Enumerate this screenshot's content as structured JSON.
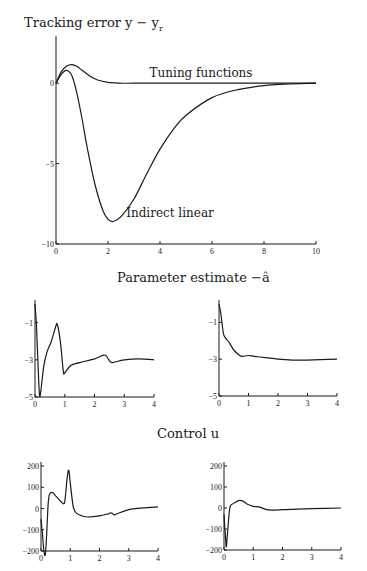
{
  "titles": {
    "tracking": "Tracking error y − y",
    "tracking_sub": "r",
    "parameter": "Parameter estimate −â",
    "control": "Control u"
  },
  "chart_data": [
    {
      "type": "line",
      "title": "Tracking error y - y_r",
      "xlabel": "",
      "ylabel": "",
      "xlim": [
        0,
        10
      ],
      "ylim": [
        -10,
        2
      ],
      "xticks": [
        0,
        2,
        4,
        6,
        8,
        10
      ],
      "yticks": [
        0,
        -5,
        -10
      ],
      "annotations": [
        "Tuning functions",
        "Indirect linear"
      ],
      "series": [
        {
          "name": "Tuning functions",
          "x": [
            0,
            0.2,
            0.4,
            0.6,
            0.8,
            1.0,
            1.3,
            1.6,
            2.0,
            2.5,
            3,
            4,
            6,
            8,
            10
          ],
          "y": [
            0,
            0.7,
            1.05,
            1.15,
            1.05,
            0.8,
            0.45,
            0.2,
            0.05,
            0.0,
            0.0,
            0.0,
            0.0,
            0.0,
            0.0
          ]
        },
        {
          "name": "Indirect linear",
          "x": [
            0,
            0.2,
            0.4,
            0.6,
            0.8,
            1.0,
            1.2,
            1.5,
            1.8,
            2.0,
            2.2,
            2.5,
            3.0,
            3.5,
            4.0,
            4.5,
            5,
            6,
            7,
            8,
            9,
            10
          ],
          "y": [
            0,
            0.55,
            0.8,
            0.5,
            -0.6,
            -2.2,
            -4.0,
            -6.3,
            -7.9,
            -8.45,
            -8.6,
            -8.3,
            -7.2,
            -5.6,
            -4.1,
            -2.9,
            -2.0,
            -0.9,
            -0.4,
            -0.15,
            -0.05,
            0.0
          ]
        }
      ]
    },
    {
      "type": "line",
      "title": "Parameter estimate -a_hat (left)",
      "xlim": [
        0,
        4
      ],
      "ylim": [
        -5,
        0
      ],
      "xticks": [
        0,
        1,
        2,
        3,
        4
      ],
      "yticks": [
        -1,
        -3,
        -5
      ],
      "series": [
        {
          "name": "left",
          "x": [
            0,
            0.05,
            0.1,
            0.15,
            0.2,
            0.3,
            0.4,
            0.55,
            0.7,
            0.75,
            0.85,
            0.95,
            1.0,
            1.2,
            1.5,
            2.0,
            2.3,
            2.4,
            2.5,
            2.6,
            3.0,
            3.5,
            4.0
          ],
          "y": [
            0,
            -1.2,
            -3.2,
            -4.9,
            -4.6,
            -3.3,
            -2.6,
            -2.0,
            -1.2,
            -1.1,
            -2.0,
            -3.6,
            -3.7,
            -3.3,
            -3.15,
            -2.95,
            -2.75,
            -2.8,
            -3.05,
            -3.15,
            -3.0,
            -2.95,
            -3.0
          ]
        }
      ]
    },
    {
      "type": "line",
      "title": "Parameter estimate -a_hat (right)",
      "xlim": [
        0,
        4
      ],
      "ylim": [
        -5,
        0
      ],
      "xticks": [
        0,
        1,
        2,
        3,
        4
      ],
      "yticks": [
        -1,
        -3,
        -5
      ],
      "series": [
        {
          "name": "right",
          "x": [
            0,
            0.05,
            0.1,
            0.15,
            0.2,
            0.35,
            0.5,
            0.7,
            0.8,
            1.0,
            1.2,
            1.5,
            2.0,
            2.5,
            3.0,
            4.0
          ],
          "y": [
            0,
            -0.4,
            -1.0,
            -1.6,
            -1.8,
            -2.1,
            -2.5,
            -2.8,
            -2.85,
            -2.8,
            -2.85,
            -2.9,
            -3.0,
            -3.05,
            -3.05,
            -3.0
          ]
        }
      ]
    },
    {
      "type": "line",
      "title": "Control u (left)",
      "xlim": [
        0,
        4
      ],
      "ylim": [
        -200,
        200
      ],
      "xticks": [
        0,
        1,
        2,
        3,
        4
      ],
      "yticks": [
        200,
        100,
        0,
        -100,
        -200
      ],
      "series": [
        {
          "name": "left",
          "x": [
            0,
            0.05,
            0.1,
            0.15,
            0.2,
            0.25,
            0.3,
            0.4,
            0.5,
            0.6,
            0.7,
            0.8,
            0.85,
            0.9,
            0.95,
            1.0,
            1.1,
            1.2,
            1.4,
            1.6,
            2.0,
            2.3,
            2.4,
            2.5,
            2.6,
            3.0,
            3.5,
            4.0
          ],
          "y": [
            -50,
            -120,
            -200,
            -215,
            -100,
            30,
            70,
            75,
            60,
            45,
            30,
            25,
            80,
            150,
            180,
            120,
            10,
            -20,
            -35,
            -40,
            -35,
            -25,
            -20,
            -30,
            -25,
            -5,
            3,
            8
          ]
        }
      ]
    },
    {
      "type": "line",
      "title": "Control u (right)",
      "xlim": [
        0,
        4
      ],
      "ylim": [
        -200,
        200
      ],
      "xticks": [
        0,
        1,
        2,
        3,
        4
      ],
      "yticks": [
        200,
        100,
        0,
        -100,
        -200
      ],
      "series": [
        {
          "name": "right",
          "x": [
            0,
            0.05,
            0.08,
            0.12,
            0.2,
            0.3,
            0.4,
            0.5,
            0.6,
            0.7,
            0.8,
            1.0,
            1.2,
            1.4,
            1.6,
            2.0,
            2.5,
            3.0,
            4.0
          ],
          "y": [
            -30,
            -140,
            -185,
            -120,
            0,
            20,
            28,
            35,
            35,
            28,
            18,
            8,
            5,
            -5,
            -10,
            -8,
            -5,
            -3,
            0
          ]
        }
      ]
    }
  ]
}
